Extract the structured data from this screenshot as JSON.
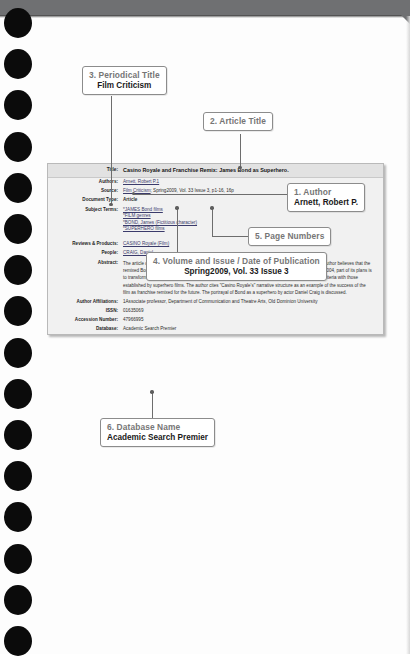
{
  "document": {
    "type": "scanned-instructional-page",
    "background_color": "#fdfdfd",
    "top_band_color": "#6f7072"
  },
  "record": {
    "rows": [
      {
        "label": "Title:",
        "value": "Casino Royale and Franchise Remix: James Bond as Superhero.",
        "style": "title"
      },
      {
        "label": "Authors:",
        "value": "Arnett, Robert P.1",
        "style": "link"
      },
      {
        "label": "Source:",
        "value": "Film Criticism; Spring2009, Vol. 33 Issue 3, p1-16, 16p",
        "style": "source"
      },
      {
        "label": "Document Type:",
        "value": "Article",
        "style": "bold"
      },
      {
        "label": "Subject Terms:",
        "value": "",
        "style": "subjects"
      },
      {
        "label": "Reviews & Products:",
        "value": "CASINO Royale (Film)",
        "style": "link"
      },
      {
        "label": "People:",
        "value": "CRAIG, Daniel",
        "style": "link"
      },
      {
        "label": "Abstract:",
        "value": "",
        "style": "abstract"
      },
      {
        "label": "Author Affiliations:",
        "value": "1Associate professor, Department of Communication and Theatre Arts, Old Dominion University",
        "style": "plain"
      },
      {
        "label": "ISSN:",
        "value": "01635069",
        "style": "plain"
      },
      {
        "label": "Accession Number:",
        "value": "47966995",
        "style": "plain"
      },
      {
        "label": "Database:",
        "value": "Academic Search Premier",
        "style": "plain"
      }
    ],
    "title_label": "Title:",
    "title_value": "Casino Royale and Franchise Remix: James Bond as Superhero.",
    "authors_label": "Authors:",
    "authors_value": "Arnett, Robert P.1",
    "source_label": "Source:",
    "source_journal": "Film Criticism",
    "source_rest": "; Spring2009, Vol. 33 Issue 3, p1-16, 16p",
    "doctype_label": "Document Type:",
    "doctype_value": "Article",
    "subject_label": "Subject Terms:",
    "subject_terms": [
      "*JAMES Bond films",
      "*FILM genres",
      "*BOND, James (Fictitious character)",
      "*SUPERHERO films"
    ],
    "reviews_label": "Reviews & Products:",
    "reviews_value": "CASINO Royale (Film)",
    "people_label": "People:",
    "people_value": "CRAIG, Daniel",
    "abstract_label": "Abstract:",
    "abstract_value": "The article discusses the role of the film \"Casino Royale\" in remixing the James Bond franchise. The author believes that the remixed Bond franchise has shifted its genre to a superhero franchise. When Sony acquired MGM in 2004, part of its plans is to transform the 007 franchise at par with \"Spiderman.\" The remixed franchise re-aligns its franchise criteria with those established by superhero films. The author cites \"Casino Royale's\" narrative structure as an example of the success of the film as franchise remixed for the future. The portrayal of Bond as a superhero by actor Daniel Craig is discussed.",
    "affiliations_label": "Author Affiliations:",
    "affiliations_value": "1Associate professor, Department of Communication and Theatre Arts, Old Dominion University",
    "issn_label": "ISSN:",
    "issn_value": "01635069",
    "accession_label": "Accession Number:",
    "accession_value": "47966995",
    "database_label": "Database:",
    "database_value": "Academic Search Premier"
  },
  "callouts": [
    {
      "id": "author",
      "number": "1. Author",
      "value": "Arnett, Robert P."
    },
    {
      "id": "article",
      "number": "2. Article Title",
      "value": ""
    },
    {
      "id": "periodical",
      "number": "3. Periodical Title",
      "value": "Film Criticism"
    },
    {
      "id": "volume",
      "number": "4. Volume and Issue / Date of Publication",
      "value": "Spring2009, Vol. 33 Issue 3"
    },
    {
      "id": "pages",
      "number": "5. Page Numbers",
      "value": ""
    },
    {
      "id": "database",
      "number": "6. Database Name",
      "value": "Academic Search Premier"
    }
  ],
  "colors": {
    "panel_bg": "#f1f1f1",
    "panel_title_bg": "#e2e2e2",
    "panel_border": "#b9b9b9",
    "callout_border": "#8c8c8c",
    "callout_number": "#767676",
    "link": "#3b3b6b",
    "connector": "#6d6d6d",
    "top_band": "#6f7072"
  }
}
